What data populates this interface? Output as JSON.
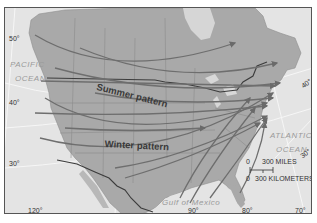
{
  "map": {
    "title_labels": {
      "summer": "Summer pattern",
      "winter": "Winter pattern"
    },
    "water_labels": {
      "pacific_line1": "PACIFIC",
      "pacific_line2": "OCEAN",
      "atlantic_line1": "ATLANTIC",
      "atlantic_line2": "OCEAN",
      "gulf": "Gulf of Mexico"
    },
    "latitude_labels": {
      "lat50": "50°",
      "lat40_west": "40°",
      "lat40_east": "40°",
      "lat30_west": "30°",
      "lat30_east": "30°"
    },
    "longitude_labels": {
      "lon120": "120°",
      "lon90": "90°",
      "lon80": "80°",
      "lon70": "70°"
    },
    "scale_bar": {
      "miles_zero": "0",
      "miles_label": "300 MILES",
      "km_zero": "0",
      "km_label": "300 KILOMETERS"
    },
    "colors": {
      "land": "#a9a9a9",
      "water": "#e4e4e4",
      "graticule": "#f4f4f4",
      "borders": "#8a8a8a",
      "national_border": "#3c3c3c",
      "tracks": "#6e6e6e"
    }
  }
}
